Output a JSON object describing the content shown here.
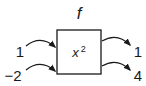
{
  "function": {
    "name": "f",
    "expression_base": "x",
    "expression_exponent": "2"
  },
  "inputs": [
    "1",
    "−2"
  ],
  "outputs": [
    "1",
    "4"
  ],
  "colors": {
    "stroke": "#1a1a1a",
    "background": "#ffffff"
  }
}
